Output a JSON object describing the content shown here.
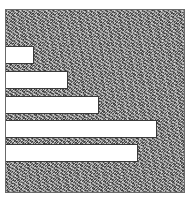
{
  "chart_data": {
    "type": "bar",
    "orientation": "horizontal",
    "title": "",
    "xlabel": "",
    "ylabel": "",
    "categories": [
      "",
      "",
      "",
      "",
      ""
    ],
    "values": [
      16,
      35,
      52,
      85,
      74
    ],
    "xlim": [
      0,
      100
    ],
    "grid": false,
    "legend": "none",
    "bar_color": "#ffffff",
    "background": "textured gray hatch"
  },
  "layout": {
    "bar_tops": [
      36,
      61,
      86,
      110,
      134
    ]
  }
}
